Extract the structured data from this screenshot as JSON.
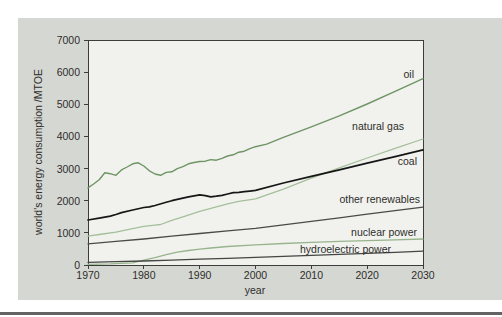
{
  "page": {
    "background": "#ffffff",
    "figure_bg": "#d5d7d2",
    "plot_bg": "#f1f2ee",
    "axis_color": "#3c3c3a",
    "text_color": "#2d2d2b",
    "separator_color": "#636363"
  },
  "chart_data": {
    "type": "line",
    "title": "",
    "xlabel": "year",
    "ylabel": "world's energy consumption /MTOE",
    "unit": "MTOE",
    "xlim": [
      1970,
      2030
    ],
    "ylim": [
      0,
      7000
    ],
    "x_ticks": [
      1970,
      1980,
      1990,
      2000,
      2010,
      2020,
      2030
    ],
    "y_ticks": [
      0,
      1000,
      2000,
      3000,
      4000,
      5000,
      6000,
      7000
    ],
    "grid": false,
    "legend_position": "inline labels right of lines",
    "series": [
      {
        "name": "oil",
        "color": "#6f9465",
        "width": 1.4,
        "points": [
          [
            1970,
            2400
          ],
          [
            1971,
            2520
          ],
          [
            1972,
            2650
          ],
          [
            1973,
            2870
          ],
          [
            1974,
            2840
          ],
          [
            1975,
            2790
          ],
          [
            1976,
            2960
          ],
          [
            1977,
            3050
          ],
          [
            1978,
            3150
          ],
          [
            1979,
            3180
          ],
          [
            1980,
            3080
          ],
          [
            1981,
            2930
          ],
          [
            1982,
            2830
          ],
          [
            1983,
            2790
          ],
          [
            1984,
            2880
          ],
          [
            1985,
            2900
          ],
          [
            1986,
            3000
          ],
          [
            1987,
            3060
          ],
          [
            1988,
            3150
          ],
          [
            1989,
            3190
          ],
          [
            1990,
            3220
          ],
          [
            1991,
            3230
          ],
          [
            1992,
            3280
          ],
          [
            1993,
            3260
          ],
          [
            1994,
            3320
          ],
          [
            1995,
            3390
          ],
          [
            1996,
            3430
          ],
          [
            1997,
            3510
          ],
          [
            1998,
            3540
          ],
          [
            1999,
            3620
          ],
          [
            2000,
            3680
          ],
          [
            2002,
            3760
          ],
          [
            2004,
            3900
          ],
          [
            2005,
            3970
          ],
          [
            2010,
            4300
          ],
          [
            2015,
            4640
          ],
          [
            2020,
            5010
          ],
          [
            2025,
            5400
          ],
          [
            2030,
            5800
          ]
        ]
      },
      {
        "name": "natural gas",
        "color": "#a5bf9b",
        "width": 1.3,
        "points": [
          [
            1970,
            900
          ],
          [
            1972,
            950
          ],
          [
            1975,
            1020
          ],
          [
            1978,
            1130
          ],
          [
            1980,
            1200
          ],
          [
            1982,
            1240
          ],
          [
            1983,
            1260
          ],
          [
            1985,
            1390
          ],
          [
            1987,
            1500
          ],
          [
            1990,
            1670
          ],
          [
            1992,
            1760
          ],
          [
            1995,
            1900
          ],
          [
            1997,
            1980
          ],
          [
            2000,
            2060
          ],
          [
            2005,
            2360
          ],
          [
            2010,
            2700
          ],
          [
            2015,
            3020
          ],
          [
            2020,
            3330
          ],
          [
            2025,
            3630
          ],
          [
            2030,
            3920
          ]
        ]
      },
      {
        "name": "coal",
        "color": "#161616",
        "width": 1.7,
        "points": [
          [
            1970,
            1400
          ],
          [
            1972,
            1460
          ],
          [
            1974,
            1520
          ],
          [
            1975,
            1570
          ],
          [
            1976,
            1630
          ],
          [
            1978,
            1710
          ],
          [
            1980,
            1790
          ],
          [
            1981,
            1810
          ],
          [
            1982,
            1850
          ],
          [
            1984,
            1950
          ],
          [
            1985,
            2000
          ],
          [
            1986,
            2040
          ],
          [
            1988,
            2120
          ],
          [
            1990,
            2180
          ],
          [
            1991,
            2160
          ],
          [
            1992,
            2120
          ],
          [
            1993,
            2140
          ],
          [
            1994,
            2170
          ],
          [
            1995,
            2210
          ],
          [
            1996,
            2250
          ],
          [
            1997,
            2260
          ],
          [
            1998,
            2280
          ],
          [
            1999,
            2300
          ],
          [
            2000,
            2320
          ],
          [
            2005,
            2550
          ],
          [
            2010,
            2760
          ],
          [
            2015,
            2960
          ],
          [
            2020,
            3170
          ],
          [
            2025,
            3370
          ],
          [
            2030,
            3580
          ]
        ]
      },
      {
        "name": "other renewables",
        "color": "#4a4a48",
        "width": 1.3,
        "points": [
          [
            1970,
            660
          ],
          [
            1975,
            735
          ],
          [
            1980,
            810
          ],
          [
            1985,
            895
          ],
          [
            1990,
            980
          ],
          [
            1995,
            1060
          ],
          [
            2000,
            1140
          ],
          [
            2005,
            1250
          ],
          [
            2010,
            1360
          ],
          [
            2015,
            1470
          ],
          [
            2020,
            1580
          ],
          [
            2025,
            1690
          ],
          [
            2030,
            1800
          ]
        ]
      },
      {
        "name": "nuclear power",
        "color": "#97b48d",
        "width": 1.3,
        "points": [
          [
            1970,
            20
          ],
          [
            1974,
            35
          ],
          [
            1976,
            50
          ],
          [
            1978,
            70
          ],
          [
            1980,
            150
          ],
          [
            1982,
            230
          ],
          [
            1984,
            320
          ],
          [
            1986,
            400
          ],
          [
            1988,
            450
          ],
          [
            1990,
            495
          ],
          [
            1992,
            530
          ],
          [
            1995,
            575
          ],
          [
            2000,
            625
          ],
          [
            2005,
            670
          ],
          [
            2010,
            705
          ],
          [
            2015,
            735
          ],
          [
            2020,
            760
          ],
          [
            2025,
            785
          ],
          [
            2030,
            810
          ]
        ]
      },
      {
        "name": "hydroelectric power",
        "color": "#454543",
        "width": 1.3,
        "points": [
          [
            1970,
            85
          ],
          [
            1975,
            105
          ],
          [
            1980,
            125
          ],
          [
            1985,
            150
          ],
          [
            1990,
            180
          ],
          [
            1995,
            210
          ],
          [
            2000,
            240
          ],
          [
            2005,
            270
          ],
          [
            2010,
            300
          ],
          [
            2015,
            330
          ],
          [
            2020,
            360
          ],
          [
            2025,
            395
          ],
          [
            2030,
            430
          ]
        ]
      }
    ]
  }
}
